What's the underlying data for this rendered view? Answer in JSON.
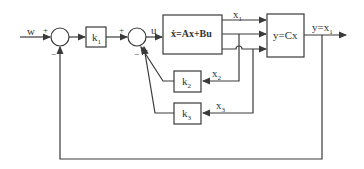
{
  "diagram": {
    "type": "state-feedback block diagram",
    "input_label": "w",
    "signs": {
      "sum1_plus": "+",
      "sum1_minus": "−",
      "sum2_plus": "+",
      "sum2_minus": "−"
    },
    "blocks": {
      "gain_k1": "k",
      "gain_k1_sub": "1",
      "state_eq": "ẋ=Ax+Bu",
      "output_eq": "y=Cx",
      "gain_k2": "k",
      "gain_k2_sub": "2",
      "gain_k3": "k",
      "gain_k3_sub": "3"
    },
    "signals": {
      "u": "u",
      "x1": "x",
      "x1_sub": "1",
      "x2": "x",
      "x2_sub": "2",
      "x3": "x",
      "x3_sub": "3",
      "output": "y=x",
      "output_sub": "1"
    },
    "colors": {
      "line": "#3a3a3a",
      "background": "#ffffff"
    }
  }
}
